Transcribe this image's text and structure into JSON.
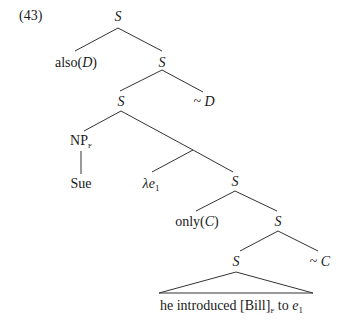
{
  "example_number": "(43)",
  "tree": {
    "root": "S",
    "also": {
      "fn": "also",
      "open": "(",
      "arg": "D",
      "close": ")"
    },
    "tilde_D": {
      "tilde": "~",
      "var": "D"
    },
    "s2": "S",
    "s3": "S",
    "np": {
      "base": "NP",
      "sub": "F"
    },
    "sue": "Sue",
    "lambda": {
      "lam": "λ",
      "var": "e",
      "sub": "1"
    },
    "s4": "S",
    "only": {
      "fn": "only",
      "open": "(",
      "arg": "C",
      "close": ")"
    },
    "s5": "S",
    "s6": "S",
    "tilde_C": {
      "tilde": "~",
      "var": "C"
    },
    "leaf": {
      "pre": "he introduced [Bill]",
      "focus_sub": "F",
      "mid": " to ",
      "var": "e",
      "var_sub": "1"
    }
  },
  "colors": {
    "line": "#333333",
    "text": "#1a1a1a",
    "background": "#ffffff"
  }
}
